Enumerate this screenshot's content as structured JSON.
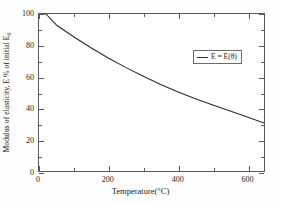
{
  "chart_data": {
    "type": "line",
    "title": "",
    "xlabel": "Temperature(°C)",
    "ylabel": "Modulus of elasticity, E % of initial E",
    "ylabel_subscript": "0",
    "xlim": [
      0,
      650
    ],
    "ylim": [
      0,
      100
    ],
    "grid": false,
    "legend_position": "upper-right",
    "xticks": [
      0,
      200,
      400,
      600
    ],
    "xticklabels": [
      "0",
      "200",
      "400",
      "600"
    ],
    "xminorticks": [
      100,
      300,
      500
    ],
    "yticks": [
      0,
      20,
      40,
      60,
      80,
      100
    ],
    "yticklabels": [
      "0",
      "20",
      "40",
      "60",
      "80",
      "100"
    ],
    "yminorticks": [
      10,
      30,
      50,
      70,
      90
    ],
    "series": [
      {
        "name": "E = E(θ)",
        "color": "#2b2b2b",
        "x": [
          0,
          20,
          50,
          100,
          150,
          200,
          250,
          300,
          350,
          400,
          450,
          500,
          550,
          600,
          650
        ],
        "y": [
          100,
          100,
          93,
          85.5,
          78.5,
          72,
          66,
          60.5,
          55.3,
          50.5,
          46.2,
          42.2,
          38.4,
          34.6,
          30.5
        ]
      }
    ]
  },
  "legend": {
    "entries": [
      {
        "label": "E = E(θ)",
        "color": "#2b2b2b"
      }
    ]
  },
  "axes": {
    "x_title": "Temperature(°C)",
    "y_title_main": "Modulus of elasticity, E % of initial E",
    "y_title_sub": "0"
  }
}
